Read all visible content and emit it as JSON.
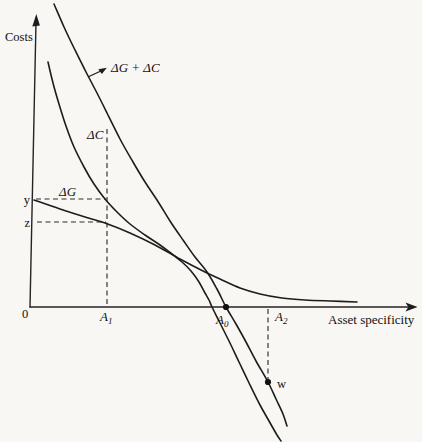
{
  "figure": {
    "bg_color": "#f8f7f3",
    "ink_color": "#1d1d1d",
    "labels": {
      "costs": "Costs",
      "asset_specificity": "Asset specificity",
      "origin": "0",
      "y_mark": "y",
      "z_mark": "z",
      "w_mark": "w",
      "sum_curve": "ΔG + ΔC",
      "dc_curve": "ΔC",
      "dg_curve": "ΔG",
      "a1": {
        "base": "A",
        "sub": "1"
      },
      "a0": {
        "base": "A",
        "sub": "0"
      },
      "a2": {
        "base": "A",
        "sub": "2"
      }
    }
  },
  "chart_data": {
    "type": "line",
    "title": "",
    "xlabel": "Asset specificity",
    "ylabel": "Costs",
    "axes_numeric": false,
    "coords": "figure pixel space 422x442, y increases downward, plot origin at [30,307]",
    "x_axis": {
      "line": [
        [
          30,
          307
        ],
        [
          410,
          307
        ]
      ],
      "arrow_tip": [
        417,
        307
      ]
    },
    "y_axis": {
      "line": [
        [
          30,
          307
        ],
        [
          36,
          22
        ]
      ],
      "arrow_tip": [
        36,
        15
      ]
    },
    "series": [
      {
        "name": "ΔG + ΔC",
        "description": "steepest curve; starts top-left, crosses the x-axis exactly at A0 (dot) and continues below the axis through point w",
        "points": [
          [
            54,
            4
          ],
          [
            64,
            27
          ],
          [
            75,
            50
          ],
          [
            86,
            72
          ],
          [
            97,
            93
          ],
          [
            107,
            113
          ],
          [
            120,
            139
          ],
          [
            133,
            162
          ],
          [
            145,
            182
          ],
          [
            157,
            200
          ],
          [
            170,
            221
          ],
          [
            183,
            240
          ],
          [
            195,
            257
          ],
          [
            207,
            272
          ],
          [
            217,
            289
          ],
          [
            226,
            307
          ],
          [
            236,
            324
          ],
          [
            246,
            342
          ],
          [
            256,
            361
          ],
          [
            268,
            382
          ],
          [
            276,
            399
          ],
          [
            283,
            414
          ],
          [
            287,
            426
          ]
        ]
      },
      {
        "name": "ΔC",
        "description": "steep curve left of the sum curve; passes level y at A1, crosses the x-axis just left of A0 and runs below the axis parallel to the sum curve",
        "points": [
          [
            48,
            62
          ],
          [
            53,
            83
          ],
          [
            59,
            104
          ],
          [
            66,
            126
          ],
          [
            74,
            147
          ],
          [
            84,
            167
          ],
          [
            94,
            184
          ],
          [
            105,
            199
          ],
          [
            117,
            212
          ],
          [
            130,
            224
          ],
          [
            145,
            235
          ],
          [
            160,
            245
          ],
          [
            172,
            254
          ],
          [
            182,
            262
          ],
          [
            191,
            271
          ],
          [
            199,
            282
          ],
          [
            205,
            293
          ],
          [
            209,
            300
          ],
          [
            212,
            307
          ],
          [
            220,
            323
          ],
          [
            229,
            341
          ],
          [
            239,
            362
          ],
          [
            250,
            385
          ],
          [
            260,
            405
          ],
          [
            269,
            421
          ],
          [
            277,
            435
          ],
          [
            281,
            441
          ]
        ]
      },
      {
        "name": "ΔG",
        "description": "flat curve; starts at level y on the cost axis, passes level z at A1, declines and approaches the x-axis asymptotically",
        "points": [
          [
            34,
            200
          ],
          [
            60,
            209
          ],
          [
            85,
            217
          ],
          [
            105,
            223
          ],
          [
            130,
            233
          ],
          [
            155,
            245
          ],
          [
            180,
            259
          ],
          [
            205,
            272
          ],
          [
            222,
            280
          ],
          [
            240,
            288
          ],
          [
            260,
            294
          ],
          [
            282,
            298
          ],
          [
            305,
            300
          ],
          [
            330,
            301
          ],
          [
            357,
            302
          ]
        ]
      }
    ],
    "guides": [
      {
        "name": "y-level-dash",
        "from": [
          36,
          199
        ],
        "to": [
          106,
          199
        ]
      },
      {
        "name": "z-level-dash",
        "from": [
          37,
          222
        ],
        "to": [
          106,
          222
        ]
      },
      {
        "name": "a1-vertical-dash",
        "from": [
          107,
          129
        ],
        "to": [
          107,
          306
        ]
      },
      {
        "name": "a2-vertical-dash",
        "from": [
          268,
          309
        ],
        "to": [
          268,
          379
        ]
      }
    ],
    "markers": [
      {
        "name": "A0",
        "at": [
          226,
          307
        ],
        "r": 3.1
      },
      {
        "name": "w",
        "at": [
          268,
          382
        ],
        "r": 3.1
      }
    ],
    "pointer_arrow": {
      "from": [
        89,
        76.5
      ],
      "to": [
        103,
        70
      ]
    },
    "annotations": [
      "Costs",
      "ΔG + ΔC",
      "ΔC",
      "ΔG",
      "y",
      "z",
      "0",
      "A1",
      "A0",
      "A2",
      "w",
      "Asset specificity"
    ]
  }
}
